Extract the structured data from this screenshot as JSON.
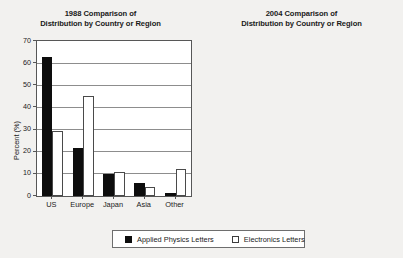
{
  "figure": {
    "background_color": "#f2f1ef",
    "plot_background_color": "#ffffff"
  },
  "legend": {
    "position": "bottom-center",
    "entries": [
      {
        "label": "Applied Physics Letters",
        "swatch": "filled-black-square",
        "color": "#0d0d0d"
      },
      {
        "label": "Electronics Letters",
        "swatch": "open-white-square",
        "color": "#ffffff"
      }
    ]
  },
  "chart_data": [
    {
      "type": "bar",
      "title": "1988 Comparison of\nDistribution by Country or Region",
      "xlabel": "",
      "ylabel": "Percent (%)",
      "categories": [
        "US",
        "Europe",
        "Japan",
        "Asia",
        "Other"
      ],
      "series": [
        {
          "name": "Applied Physics Letters",
          "color": "#0d0d0d",
          "values": [
            63,
            21.5,
            10,
            6,
            1.5
          ]
        },
        {
          "name": "Electronics Letters",
          "color": "#ffffff",
          "values": [
            29.5,
            45,
            10.8,
            4,
            12
          ]
        }
      ],
      "ylim": [
        0,
        70
      ],
      "yticks": [
        0,
        10,
        20,
        30,
        40,
        50,
        60,
        70
      ],
      "ytick_labels": [
        "0",
        "10",
        "20",
        "30",
        "40",
        "50",
        "60",
        "70"
      ],
      "grid": true,
      "legend": "shared-bottom"
    },
    {
      "type": "bar",
      "title": "2004 Comparison of\nDistribution by Country or Region",
      "xlabel": "",
      "ylabel": "Percent (%)",
      "categories": [
        "US",
        "Europe",
        "Japan",
        "Asia",
        "Other"
      ],
      "series": [
        {
          "name": "Applied Physics Letters",
          "color": "#0d0d0d",
          "values": [
            30,
            29.5,
            15,
            23,
            5.5
          ]
        },
        {
          "name": "Electronics Letters",
          "color": "#ffffff",
          "values": [
            19.5,
            38.5,
            3,
            38.5,
            8.5
          ]
        }
      ],
      "ylim": [
        0,
        70
      ],
      "yticks": [
        0,
        10,
        20,
        30,
        40,
        50,
        60,
        70
      ],
      "ytick_labels": [
        "0",
        "10",
        "20",
        "30",
        "40",
        "50",
        "60",
        "70"
      ],
      "grid": true,
      "legend": "shared-bottom"
    }
  ]
}
